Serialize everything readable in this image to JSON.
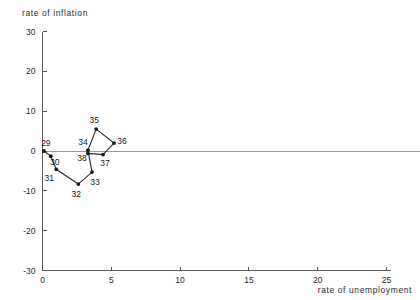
{
  "chart_data": {
    "type": "line",
    "title": "",
    "xlabel": "rate of unemployment",
    "ylabel": "rate of inflation",
    "xlim": [
      0,
      25
    ],
    "ylim": [
      -30,
      30
    ],
    "xticks": [
      0,
      5,
      10,
      15,
      20,
      25
    ],
    "xtick_labels": [
      "0",
      "5",
      "10",
      "15",
      "20",
      "25"
    ],
    "yticks": [
      -30,
      -20,
      -10,
      0,
      10,
      20,
      30
    ],
    "ytick_labels": [
      "-30",
      "-20",
      "-10",
      "0",
      "10",
      "20",
      "30"
    ],
    "grid": false,
    "legend": "none",
    "zero_line": true,
    "series": [
      {
        "name": "year path",
        "point_labels": [
          "29",
          "30",
          "31",
          "32",
          "33",
          "34",
          "35",
          "36",
          "37",
          "38"
        ],
        "x": [
          0.1,
          0.6,
          1.0,
          2.6,
          3.6,
          3.3,
          3.9,
          5.2,
          4.4,
          3.3
        ],
        "y": [
          0.0,
          -1.3,
          -4.6,
          -8.3,
          -5.3,
          0.2,
          5.5,
          2.0,
          -0.9,
          -0.6
        ],
        "label_offsets": [
          {
            "dx": 2,
            "dy": -5
          },
          {
            "dx": 4,
            "dy": 9
          },
          {
            "dx": -7,
            "dy": 12
          },
          {
            "dx": -2,
            "dy": 13
          },
          {
            "dx": 3,
            "dy": 13
          },
          {
            "dx": -5,
            "dy": -5
          },
          {
            "dx": -2,
            "dy": -6
          },
          {
            "dx": 8,
            "dy": 1
          },
          {
            "dx": 2,
            "dy": 11
          },
          {
            "dx": -6,
            "dy": 8
          }
        ]
      }
    ]
  }
}
